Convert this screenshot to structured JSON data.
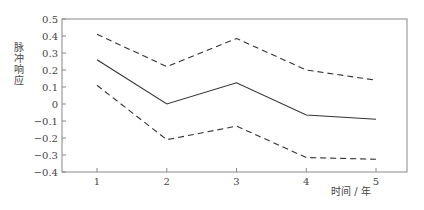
{
  "chart_data": {
    "type": "line",
    "title": "",
    "xlabel": "时间 / 年",
    "ylabel": "脉冲响应",
    "x": [
      1,
      2,
      3,
      4,
      5
    ],
    "ylim": [
      -0.4,
      0.5
    ],
    "yticks": [
      "0.5",
      "0.4",
      "0.3",
      "0.2",
      "0.1",
      "0",
      "−0.1",
      "−0.2",
      "−0.3",
      "−0.4"
    ],
    "ytick_values": [
      0.5,
      0.4,
      0.3,
      0.2,
      0.1,
      0,
      -0.1,
      -0.2,
      -0.3,
      -0.4
    ],
    "xticks": [
      "1",
      "2",
      "3",
      "4",
      "5"
    ],
    "grid": false,
    "legend": null,
    "series": [
      {
        "name": "upper bound",
        "style": "dashed",
        "values": [
          0.41,
          0.22,
          0.385,
          0.2,
          0.14
        ]
      },
      {
        "name": "impulse response",
        "style": "solid",
        "values": [
          0.26,
          0.0,
          0.125,
          -0.065,
          -0.09
        ]
      },
      {
        "name": "lower bound",
        "style": "dashed",
        "values": [
          0.11,
          -0.21,
          -0.13,
          -0.315,
          -0.325
        ]
      }
    ]
  },
  "colors": {
    "axis": "#888888",
    "line": "#333333",
    "text": "#444444"
  }
}
